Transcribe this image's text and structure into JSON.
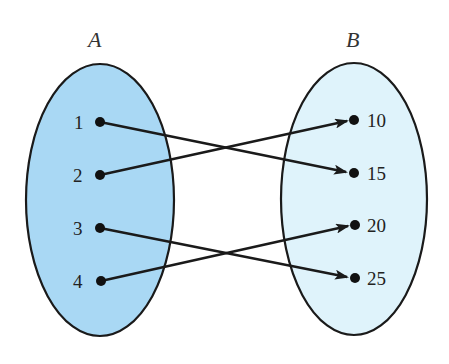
{
  "diagram": {
    "type": "mapping",
    "sets": [
      {
        "id": "A",
        "title": "A",
        "fill": "#a9d8f4",
        "elements": [
          "1",
          "2",
          "3",
          "4"
        ]
      },
      {
        "id": "B",
        "title": "B",
        "fill": "#dff3fb",
        "elements": [
          "10",
          "15",
          "20",
          "25"
        ]
      }
    ],
    "mappings": [
      {
        "from": "1",
        "to": "15"
      },
      {
        "from": "2",
        "to": "10"
      },
      {
        "from": "3",
        "to": "25"
      },
      {
        "from": "4",
        "to": "20"
      }
    ],
    "stroke_color": "#1a1a1a"
  }
}
